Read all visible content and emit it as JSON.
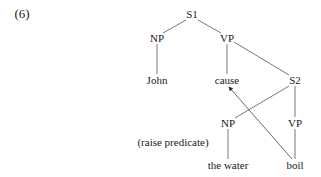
{
  "example_number": "(6)",
  "nodes": {
    "s1": {
      "label": "S1",
      "x": 192,
      "y": 14
    },
    "np1": {
      "label": "NP",
      "x": 157,
      "y": 38
    },
    "vp1": {
      "label": "VP",
      "x": 227,
      "y": 38
    },
    "john": {
      "label": "John",
      "x": 157,
      "y": 80
    },
    "cause": {
      "label": "cause",
      "x": 227,
      "y": 80
    },
    "s2": {
      "label": "S2",
      "x": 295,
      "y": 80
    },
    "np2": {
      "label": "NP",
      "x": 228,
      "y": 123
    },
    "vp2": {
      "label": "VP",
      "x": 295,
      "y": 123
    },
    "the_water": {
      "label": "the water",
      "x": 228,
      "y": 165
    },
    "boil": {
      "label": "boil",
      "x": 295,
      "y": 165
    }
  },
  "annotation": {
    "label": "(raise predicate)",
    "x": 173,
    "y": 142
  },
  "edges": [
    [
      "s1",
      "np1"
    ],
    [
      "s1",
      "vp1"
    ],
    [
      "np1",
      "john"
    ],
    [
      "vp1",
      "cause"
    ],
    [
      "vp1",
      "s2"
    ],
    [
      "s2",
      "np2"
    ],
    [
      "s2",
      "vp2"
    ],
    [
      "np2",
      "the_water"
    ],
    [
      "vp2",
      "boil"
    ]
  ],
  "movement_arrow": {
    "from": "boil",
    "to": "cause",
    "meaning": "raise predicate"
  },
  "colors": {
    "line": "#444444",
    "text": "#1a1a1a"
  }
}
